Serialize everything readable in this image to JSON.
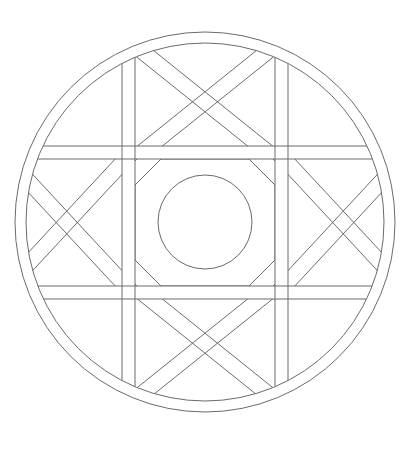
{
  "document": {
    "title": "Geometric Mandala Line Drawing",
    "kind": "line-art-illustration",
    "background_color": "#ffffff",
    "stroke_color": "#6b6b6b",
    "stroke_width": 1,
    "canvas": {
      "width": 415,
      "height": 449
    }
  },
  "geometry": {
    "center": {
      "x": 205,
      "y": 222
    },
    "outer_ring": {
      "name": "outer-double-circle",
      "outer_radius": 190,
      "inner_radius": 179
    },
    "grid": {
      "name": "lattice-double-bands",
      "band_width": 13,
      "vertical_band_centers": [
        128.5,
        281.5
      ],
      "horizontal_band_centers": [
        152.5,
        292.5
      ],
      "vertical_bands": [
        {
          "x_left": 122,
          "x_right": 135
        },
        {
          "x_left": 275,
          "x_right": 288
        }
      ],
      "horizontal_bands": [
        {
          "y_top": 146,
          "y_bottom": 159
        },
        {
          "y_top": 286,
          "y_bottom": 299
        }
      ]
    },
    "center_motif": {
      "name": "central-octagon-and-circle",
      "octagon_radius": 63,
      "octagon_corner_cut": 26,
      "circle_radius": 47
    },
    "edge_cells": [
      {
        "id": "top",
        "cx": 205,
        "cy": 96,
        "arc_bulge": "down"
      },
      {
        "id": "bottom",
        "cx": 205,
        "cy": 348,
        "arc_bulge": "up"
      },
      {
        "id": "left",
        "cx": 79,
        "cy": 222,
        "arc_bulge": "right"
      },
      {
        "id": "right",
        "cx": 331,
        "cy": 222,
        "arc_bulge": "left"
      }
    ],
    "corner_cells": [
      {
        "id": "top-left",
        "content": "empty"
      },
      {
        "id": "top-right",
        "content": "empty"
      },
      {
        "id": "bottom-left",
        "content": "empty"
      },
      {
        "id": "bottom-right",
        "content": "empty"
      }
    ]
  },
  "legend": {
    "elements": [
      "outer double circle ring",
      "3x3 double-band lattice",
      "diagonal X bands in four edge cells",
      "semicircular arcs in four edge cells",
      "central octagon frame",
      "central circle"
    ]
  }
}
